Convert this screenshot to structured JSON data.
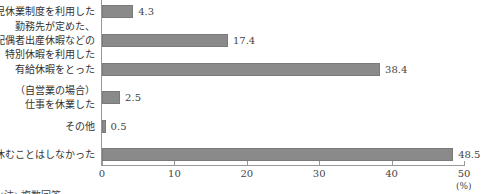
{
  "chart_data": {
    "type": "bar",
    "orientation": "horizontal",
    "categories": [
      "育児休業制度を利用した",
      "勤務先が定めた、配偶者出産休暇などの特別休暇を利用した",
      "有給休暇をとった",
      "（自営業の場合）仕事を休業した",
      "その他",
      "休むことはしなかった"
    ],
    "category_lines": [
      [
        "育児休業制度を利用した"
      ],
      [
        "勤務先が定めた、",
        "配偶者出産休暇などの",
        "特別休暇を利用した"
      ],
      [
        "有給休暇をとった"
      ],
      [
        "（自営業の場合）",
        "仕事を休業した"
      ],
      [
        "その他"
      ],
      [
        "休むことはしなかった"
      ]
    ],
    "values": [
      4.3,
      17.4,
      38.4,
      2.5,
      0.5,
      48.5
    ],
    "value_labels": [
      "4.3",
      "17.4",
      "38.4",
      "2.5",
      "0.5",
      "48.5"
    ],
    "xlim": [
      0,
      50
    ],
    "xticks": [
      "0",
      "10",
      "20",
      "30",
      "40",
      "50"
    ],
    "xlabel": "(%)",
    "note": "(注) 複数回答",
    "bar_color": "#8a8a8a"
  }
}
